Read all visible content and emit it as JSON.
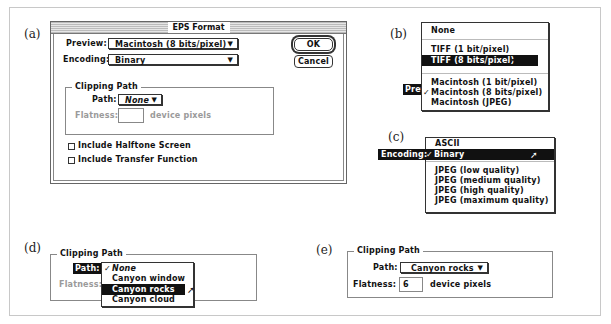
{
  "panels": {
    "a": "(a)",
    "b": "(b)",
    "c": "(c)",
    "d": "(d)",
    "e": "(e)"
  },
  "dialog": {
    "title": "EPS Format",
    "preview_label": "Preview:",
    "preview_value": "Macintosh (8 bits/pixel)",
    "encoding_label": "Encoding:",
    "encoding_value": "Binary",
    "ok_label": "OK",
    "cancel_label": "Cancel",
    "clipping_title": "Clipping Path",
    "path_label": "Path:",
    "path_value": "None",
    "flatness_label": "Flatness:",
    "flatness_value": "",
    "flatness_units": "device pixels",
    "halftone_label": "Include Halftone Screen",
    "halftone_checked": false,
    "transfer_label": "Include Transfer Function",
    "transfer_checked": false
  },
  "preview_menu": {
    "label": "Preview:",
    "items": [
      {
        "label": "None"
      },
      {
        "label": "TIFF (1 bit/pixel)"
      },
      {
        "label": "TIFF (8 bits/pixel)",
        "highlighted": true
      },
      {
        "label": "Macintosh (1 bit/pixel)"
      },
      {
        "label": "Macintosh (8 bits/pixel)",
        "checked": true
      },
      {
        "label": "Macintosh (JPEG)"
      }
    ]
  },
  "encoding_menu": {
    "label": "Encoding:",
    "items": [
      {
        "label": "ASCII"
      },
      {
        "label": "Binary",
        "checked": true,
        "highlighted": true
      },
      {
        "label": "JPEG (low quality)"
      },
      {
        "label": "JPEG (medium quality)"
      },
      {
        "label": "JPEG (high quality)"
      },
      {
        "label": "JPEG (maximum quality)"
      }
    ]
  },
  "path_menu": {
    "group_title": "Clipping Path",
    "label": "Path:",
    "flatness_label": "Flatness:",
    "items": [
      {
        "label": "None",
        "checked": true
      },
      {
        "label": "Canyon window"
      },
      {
        "label": "Canyon rocks",
        "highlighted": true
      },
      {
        "label": "Canyon cloud"
      }
    ]
  },
  "final_state": {
    "group_title": "Clipping Path",
    "path_label": "Path:",
    "path_value": "Canyon rocks",
    "flatness_label": "Flatness:",
    "flatness_value": "6",
    "flatness_units": "device pixels"
  },
  "glyphs": {
    "check": "✓",
    "down_arrow": "▼",
    "cursor": "➚"
  }
}
